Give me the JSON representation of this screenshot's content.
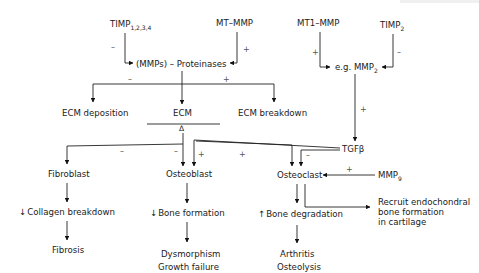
{
  "diagram": {
    "type": "flowchart",
    "title": "",
    "nodes": {
      "timp1234": {
        "label": "TIMP",
        "subscript": "1,2,3,4"
      },
      "mt_mmp": {
        "label": "MT–MMP"
      },
      "mt1_mmp": {
        "label": "MT1–MMP"
      },
      "timp2": {
        "label": "TIMP",
        "subscript": "2"
      },
      "mmps": {
        "label": "(MMPs) – Proteinases"
      },
      "mmp2": {
        "label": "e.g. MMP",
        "subscript": "2"
      },
      "ecm_deposition": {
        "label": "ECM deposition"
      },
      "ecm": {
        "label": "ECM"
      },
      "ecm_delta": {
        "label": "Δ"
      },
      "ecm_breakdown": {
        "label": "ECM breakdown"
      },
      "tgfb": {
        "label": "TGFβ"
      },
      "fibroblast": {
        "label": "Fibroblast"
      },
      "osteoblast": {
        "label": "Osteoblast"
      },
      "osteoclast": {
        "label": "Osteoclast"
      },
      "mmp9": {
        "label": "MMP",
        "subscript": "9"
      },
      "collagen_breakdown": {
        "label": "Collagen breakdown",
        "prefix": "↓"
      },
      "bone_formation": {
        "label": "Bone formation",
        "prefix": "↓"
      },
      "bone_degradation": {
        "label": "Bone degradation",
        "prefix": "↑"
      },
      "recruit": {
        "lines": [
          "Recruit endochondral",
          "bone formation",
          "in cartilage"
        ]
      },
      "fibrosis": {
        "label": "Fibrosis"
      },
      "dysmorphism": {
        "lines": [
          "Dysmorphism",
          "Growth failure"
        ]
      },
      "arthritis": {
        "lines": [
          "Arthritis",
          "Osteolysis"
        ]
      }
    },
    "signs": {
      "timp1234_to_mmps": "–",
      "mtmmp_to_mmps": "+",
      "mmps_to_deposition": "–",
      "mmps_to_breakdown": "+",
      "mt1mmp_to_mmp2": "+",
      "timp2_to_mmp2": "–",
      "mmp2_to_tgfb": "+",
      "ecm_to_fibroblast": "–",
      "ecm_to_osteoblast": "–",
      "tgfb_to_osteoblast": "+",
      "tgfb_to_osteoclast_a": "+",
      "tgfb_to_osteoclast_b": "–",
      "mmp9_to_osteoclast": "+"
    },
    "edges": [
      {
        "from": "timp1234",
        "to": "mmps",
        "sign": "–"
      },
      {
        "from": "mt_mmp",
        "to": "mmps",
        "sign": "+"
      },
      {
        "from": "mmps",
        "to": "ecm_deposition",
        "sign": "–"
      },
      {
        "from": "mmps",
        "to": "ecm"
      },
      {
        "from": "mmps",
        "to": "ecm_breakdown",
        "sign": "+"
      },
      {
        "from": "mt1_mmp",
        "to": "mmp2",
        "sign": "+"
      },
      {
        "from": "timp2",
        "to": "mmp2",
        "sign": "–"
      },
      {
        "from": "mmp2",
        "to": "tgfb",
        "sign": "+"
      },
      {
        "from": "ecm",
        "to": "fibroblast",
        "sign": "–"
      },
      {
        "from": "ecm",
        "to": "osteoblast",
        "sign": "–"
      },
      {
        "from": "ecm",
        "to": "osteoclast"
      },
      {
        "from": "tgfb",
        "to": "osteoblast",
        "sign": "+"
      },
      {
        "from": "tgfb",
        "to": "osteoclast",
        "sign": "+"
      },
      {
        "from": "tgfb",
        "to": "osteoclast",
        "sign": "–"
      },
      {
        "from": "mmp9",
        "to": "osteoclast",
        "sign": "+"
      },
      {
        "from": "fibroblast",
        "to": "collagen_breakdown"
      },
      {
        "from": "collagen_breakdown",
        "to": "fibrosis"
      },
      {
        "from": "osteoblast",
        "to": "bone_formation"
      },
      {
        "from": "bone_formation",
        "to": "dysmorphism"
      },
      {
        "from": "osteoclast",
        "to": "bone_degradation"
      },
      {
        "from": "osteoclast",
        "to": "recruit"
      },
      {
        "from": "bone_degradation",
        "to": "arthritis"
      }
    ]
  }
}
